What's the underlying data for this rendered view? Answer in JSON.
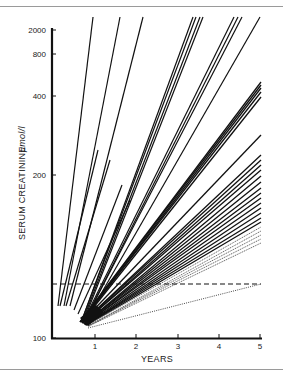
{
  "chart_data": {
    "type": "line",
    "title": "",
    "xlabel": "YEARS",
    "ylabel": "SERUM CREATININE",
    "ylabel_unit": "μmol/l",
    "yscale": "log",
    "xlim": [
      0,
      5
    ],
    "ylim": [
      100,
      2000
    ],
    "x_ticks": [
      "1",
      "2",
      "3",
      "4",
      "5"
    ],
    "y_ticks": [
      "100",
      "200",
      "400",
      "800",
      "2000"
    ],
    "grid": false,
    "legend": null,
    "reference_lines": [
      {
        "name": "normal-upper-limit",
        "style": "dashed",
        "y": 125,
        "x_range": [
          0,
          5
        ]
      },
      {
        "name": "normal-trend",
        "style": "dotted",
        "points": [
          [
            0.85,
            108
          ],
          [
            5,
            125
          ]
        ]
      }
    ],
    "series_description": "Fan of individual patient serum creatinine progression lines radiating from approx (0.8 yr, ~110 μmol/l); steep lines exceed 2000 within 1–5 years, shallower lines end at 5 years between ~150 and ~500 μmol/l",
    "series": [
      {
        "name": "steep-1",
        "points": [
          [
            0.15,
            120
          ],
          [
            1.0,
            2000
          ]
        ]
      },
      {
        "name": "steep-2",
        "points": [
          [
            0.25,
            120
          ],
          [
            1.65,
            2000
          ]
        ]
      },
      {
        "name": "steep-3",
        "points": [
          [
            0.4,
            120
          ],
          [
            2.2,
            2000
          ]
        ]
      },
      {
        "name": "steep-4",
        "points": [
          [
            0.8,
            110
          ],
          [
            3.4,
            2000
          ]
        ]
      },
      {
        "name": "steep-5",
        "points": [
          [
            0.8,
            110
          ],
          [
            3.5,
            2000
          ]
        ]
      },
      {
        "name": "steep-6",
        "points": [
          [
            0.8,
            110
          ],
          [
            3.6,
            2000
          ]
        ]
      },
      {
        "name": "steep-7",
        "points": [
          [
            0.8,
            110
          ],
          [
            3.65,
            2000
          ]
        ]
      },
      {
        "name": "steep-8",
        "points": [
          [
            0.8,
            110
          ],
          [
            4.4,
            2000
          ]
        ]
      },
      {
        "name": "steep-9",
        "points": [
          [
            0.8,
            110
          ],
          [
            4.5,
            2000
          ]
        ]
      },
      {
        "name": "steep-10",
        "points": [
          [
            0.8,
            110
          ],
          [
            4.6,
            2000
          ]
        ]
      },
      {
        "name": "steep-11",
        "points": [
          [
            0.8,
            110
          ],
          [
            5.0,
            2000
          ]
        ]
      },
      {
        "name": "mid-1",
        "points": [
          [
            0.8,
            110
          ],
          [
            5,
            480
          ]
        ]
      },
      {
        "name": "mid-2",
        "points": [
          [
            0.8,
            110
          ],
          [
            5,
            460
          ]
        ]
      },
      {
        "name": "mid-3",
        "points": [
          [
            0.8,
            110
          ],
          [
            5,
            440
          ]
        ]
      },
      {
        "name": "mid-4",
        "points": [
          [
            0.8,
            110
          ],
          [
            5,
            420
          ]
        ]
      },
      {
        "name": "mid-5",
        "points": [
          [
            0.8,
            110
          ],
          [
            5,
            400
          ]
        ]
      },
      {
        "name": "mid-6",
        "points": [
          [
            0.8,
            110
          ],
          [
            5,
            300
          ]
        ]
      },
      {
        "name": "low-1",
        "points": [
          [
            0.8,
            110
          ],
          [
            5,
            250
          ]
        ]
      },
      {
        "name": "low-2",
        "points": [
          [
            0.8,
            110
          ],
          [
            5,
            240
          ]
        ]
      },
      {
        "name": "low-3",
        "points": [
          [
            0.8,
            110
          ],
          [
            5,
            232
          ]
        ]
      },
      {
        "name": "low-4",
        "points": [
          [
            0.8,
            110
          ],
          [
            5,
            225
          ]
        ]
      },
      {
        "name": "low-5",
        "points": [
          [
            0.8,
            110
          ],
          [
            5,
            215
          ]
        ]
      },
      {
        "name": "low-6",
        "points": [
          [
            0.8,
            110
          ],
          [
            5,
            205
          ]
        ]
      },
      {
        "name": "low-7",
        "points": [
          [
            0.8,
            110
          ],
          [
            5,
            198
          ]
        ]
      },
      {
        "name": "low-8",
        "points": [
          [
            0.8,
            110
          ],
          [
            5,
            190
          ]
        ]
      },
      {
        "name": "low-9",
        "points": [
          [
            0.8,
            110
          ],
          [
            5,
            183
          ]
        ]
      },
      {
        "name": "low-10",
        "points": [
          [
            0.8,
            110
          ],
          [
            5,
            177
          ]
        ]
      },
      {
        "name": "low-11",
        "points": [
          [
            0.8,
            110
          ],
          [
            5,
            171
          ]
        ]
      },
      {
        "name": "low-12",
        "points": [
          [
            0.8,
            110
          ],
          [
            5,
            165
          ]
        ]
      },
      {
        "name": "low-13",
        "points": [
          [
            0.8,
            110
          ],
          [
            5,
            160
          ]
        ]
      },
      {
        "name": "low-14",
        "points": [
          [
            0.8,
            110
          ],
          [
            5,
            155
          ]
        ]
      }
    ]
  },
  "axes": {
    "x_title": "YEARS",
    "y_title": "SERUM CREATININE",
    "y_unit": "μmol/l",
    "x_ticks": [
      {
        "label": "1",
        "px": 95
      },
      {
        "label": "2",
        "px": 136
      },
      {
        "label": "3",
        "px": 178
      },
      {
        "label": "4",
        "px": 219
      },
      {
        "label": "5",
        "px": 260
      }
    ],
    "y_ticks": [
      {
        "label": "2000",
        "py": 30
      },
      {
        "label": "800",
        "py": 54
      },
      {
        "label": "400",
        "py": 96
      },
      {
        "label": "200",
        "py": 175
      },
      {
        "label": "100",
        "py": 338
      }
    ]
  },
  "lines_px": {
    "steep": [
      [
        [
          58,
          306
        ],
        [
          93,
          17
        ]
      ],
      [
        [
          64,
          306
        ],
        [
          120,
          17
        ]
      ],
      [
        [
          70,
          306
        ],
        [
          143,
          17
        ]
      ],
      [
        [
          82,
          320
        ],
        [
          193,
          17
        ]
      ],
      [
        [
          82,
          320
        ],
        [
          196,
          17
        ]
      ],
      [
        [
          83,
          320
        ],
        [
          200,
          17
        ]
      ],
      [
        [
          84,
          320
        ],
        [
          203,
          17
        ]
      ],
      [
        [
          84,
          320
        ],
        [
          234,
          17
        ]
      ],
      [
        [
          85,
          320
        ],
        [
          238,
          17
        ]
      ],
      [
        [
          85,
          320
        ],
        [
          242,
          17
        ]
      ],
      [
        [
          86,
          320
        ],
        [
          260,
          17
        ]
      ]
    ],
    "extra_left": [
      [
        [
          60,
          306
        ],
        [
          98,
          150
        ]
      ],
      [
        [
          66,
          306
        ],
        [
          110,
          160
        ]
      ],
      [
        [
          74,
          310
        ],
        [
          122,
          185
        ]
      ],
      [
        [
          78,
          314
        ],
        [
          130,
          200
        ]
      ]
    ],
    "mid": [
      [
        [
          80,
          322
        ],
        [
          261,
          82
        ]
      ],
      [
        [
          80,
          322
        ],
        [
          261,
          85
        ]
      ],
      [
        [
          81,
          322
        ],
        [
          261,
          88
        ]
      ],
      [
        [
          81,
          322
        ],
        [
          261,
          92
        ]
      ],
      [
        [
          82,
          322
        ],
        [
          261,
          97
        ]
      ],
      [
        [
          82,
          322
        ],
        [
          261,
          135
        ]
      ]
    ],
    "low": [
      [
        [
          82,
          323
        ],
        [
          261,
          155
        ]
      ],
      [
        [
          82,
          323
        ],
        [
          261,
          160
        ]
      ],
      [
        [
          83,
          323
        ],
        [
          261,
          165
        ]
      ],
      [
        [
          83,
          323
        ],
        [
          261,
          170
        ]
      ],
      [
        [
          84,
          324
        ],
        [
          261,
          176
        ]
      ],
      [
        [
          84,
          324
        ],
        [
          261,
          182
        ]
      ],
      [
        [
          84,
          324
        ],
        [
          261,
          188
        ]
      ],
      [
        [
          85,
          324
        ],
        [
          261,
          193
        ]
      ],
      [
        [
          85,
          324
        ],
        [
          261,
          198
        ]
      ],
      [
        [
          85,
          325
        ],
        [
          261,
          203
        ]
      ],
      [
        [
          86,
          325
        ],
        [
          261,
          208
        ]
      ],
      [
        [
          86,
          325
        ],
        [
          261,
          213
        ]
      ],
      [
        [
          86,
          325
        ],
        [
          261,
          218
        ]
      ],
      [
        [
          87,
          325
        ],
        [
          261,
          222
        ]
      ]
    ],
    "faint": [
      [
        [
          87,
          325
        ],
        [
          261,
          227
        ]
      ],
      [
        [
          88,
          326
        ],
        [
          261,
          231
        ]
      ],
      [
        [
          88,
          326
        ],
        [
          261,
          235
        ]
      ],
      [
        [
          88,
          326
        ],
        [
          261,
          239
        ]
      ],
      [
        [
          89,
          326
        ],
        [
          261,
          243
        ]
      ]
    ],
    "dashed": [
      [
        52,
        284
      ],
      [
        261,
        284
      ]
    ],
    "dotted": [
      [
        88,
        328
      ],
      [
        261,
        284
      ]
    ]
  }
}
